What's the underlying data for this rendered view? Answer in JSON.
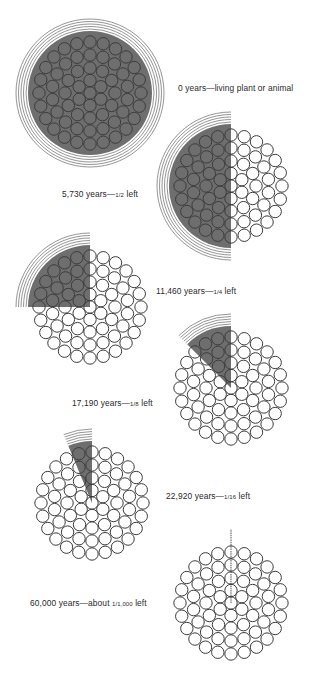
{
  "colors": {
    "fill": "#6e6e6e",
    "stroke": "#3c3c3c",
    "arc": "#7a7a7a",
    "background": "#ffffff",
    "text": "#2a2a2a"
  },
  "stages": [
    {
      "id": "stage-0",
      "cx": 90,
      "cy": 93,
      "fraction": 1,
      "label_pre": "0 years—living plant or animal",
      "label_frac": "",
      "label_post": "",
      "label_x": 178,
      "label_y": 83
    },
    {
      "id": "stage-1",
      "cx": 231,
      "cy": 186,
      "fraction": 0.5,
      "label_pre": "5,730 years—",
      "label_frac": "1/2",
      "label_post": " left",
      "label_x": 62,
      "label_y": 189
    },
    {
      "id": "stage-2",
      "cx": 90,
      "cy": 307,
      "fraction": 0.25,
      "label_pre": "11,460 years—",
      "label_frac": "1/4",
      "label_post": " left",
      "label_x": 156,
      "label_y": 286
    },
    {
      "id": "stage-3",
      "cx": 231,
      "cy": 388,
      "fraction": 0.125,
      "label_pre": "17,190 years—",
      "label_frac": "1/8",
      "label_post": " left",
      "label_x": 72,
      "label_y": 398
    },
    {
      "id": "stage-4",
      "cx": 92,
      "cy": 503,
      "fraction": 0.0625,
      "label_pre": "22,920 years—",
      "label_frac": "1/16",
      "label_post": " left",
      "label_x": 166,
      "label_y": 491
    },
    {
      "id": "stage-5",
      "cx": 231,
      "cy": 603,
      "fraction": 0.001,
      "label_pre": "60,000 years—about ",
      "label_frac": "1/1,000",
      "label_post": " left",
      "label_x": 30,
      "label_y": 598
    }
  ],
  "geometry": {
    "atom_radius": 6.2,
    "rings": [
      {
        "r": 0,
        "n": 1
      },
      {
        "r": 12.5,
        "n": 6
      },
      {
        "r": 25,
        "n": 12
      },
      {
        "r": 38,
        "n": 18
      },
      {
        "r": 51,
        "n": 24
      }
    ],
    "fill_radius": 62,
    "arc_radii": [
      64,
      66.5,
      69,
      71.5,
      74
    ]
  }
}
